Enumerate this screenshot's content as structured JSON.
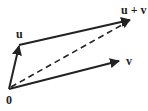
{
  "diagram": {
    "title": "",
    "labels": {
      "origin": "0",
      "u": "u",
      "v": "v",
      "sum": "u + v"
    },
    "colors": {
      "stroke": "#222222",
      "background": "#ffffff"
    },
    "points": {
      "origin": [
        9,
        89
      ],
      "u": [
        19,
        45
      ],
      "v": [
        120,
        61
      ],
      "sum": [
        131,
        20
      ]
    },
    "edges": [
      {
        "from": "origin",
        "to": "u",
        "style": "solid",
        "arrow": true
      },
      {
        "from": "origin",
        "to": "v",
        "style": "solid",
        "arrow": true
      },
      {
        "from": "u",
        "to": "sum",
        "style": "solid",
        "arrow": true
      },
      {
        "from": "origin",
        "to": "sum",
        "style": "dashed",
        "arrow": true
      }
    ]
  }
}
